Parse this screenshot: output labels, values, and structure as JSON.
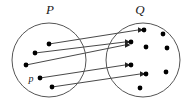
{
  "diagram": {
    "type": "set-mapping-diagram",
    "background_color": "#ffffff",
    "circle_stroke_color": "#555555",
    "dot_color": "#000000",
    "line_color": "#333333",
    "sets": [
      {
        "name": "set-p",
        "label": "P",
        "label_x": 50,
        "label_y": 13,
        "cx": 49,
        "cy": 60,
        "r": 37,
        "elements": [
          {
            "name": "p-element-1",
            "x": 49,
            "y": 44,
            "label": ""
          },
          {
            "name": "p-element-2",
            "x": 35,
            "y": 53,
            "label": ""
          },
          {
            "name": "p-element-3",
            "x": 26,
            "y": 65,
            "label": ""
          },
          {
            "name": "p-element-4",
            "x": 40,
            "y": 78,
            "label": "p",
            "label_x": 31,
            "label_y": 81
          },
          {
            "name": "p-element-5",
            "x": 52,
            "y": 87,
            "label": ""
          }
        ]
      },
      {
        "name": "set-q",
        "label": "Q",
        "label_x": 140,
        "label_y": 13,
        "cx": 143,
        "cy": 60,
        "r": 37,
        "elements": [
          {
            "name": "q-element-1",
            "x": 144,
            "y": 30,
            "label": ""
          },
          {
            "name": "q-element-2",
            "x": 131,
            "y": 42,
            "label": ""
          },
          {
            "name": "q-element-3",
            "x": 163,
            "y": 34,
            "label": ""
          },
          {
            "name": "q-element-4",
            "x": 146,
            "y": 47,
            "label": ""
          },
          {
            "name": "q-element-5",
            "x": 167,
            "y": 48,
            "label": ""
          },
          {
            "name": "q-element-6",
            "x": 131,
            "y": 65,
            "label": ""
          },
          {
            "name": "q-element-7",
            "x": 146,
            "y": 74,
            "label": ""
          },
          {
            "name": "q-element-8",
            "x": 166,
            "y": 72,
            "label": ""
          },
          {
            "name": "q-element-9",
            "x": 140,
            "y": 88,
            "label": ""
          }
        ]
      }
    ],
    "mappings": [
      {
        "name": "mapping-arrow-1",
        "from": "p-element-1",
        "to": "q-element-1",
        "x1": 49,
        "y1": 44,
        "x2": 140,
        "y2": 30
      },
      {
        "name": "mapping-arrow-2",
        "from": "p-element-2",
        "to": "q-element-2",
        "x1": 35,
        "y1": 53,
        "x2": 127,
        "y2": 42
      },
      {
        "name": "mapping-arrow-3",
        "from": "p-element-3",
        "to": "q-element-2",
        "x1": 26,
        "y1": 65,
        "x2": 127,
        "y2": 42
      },
      {
        "name": "mapping-arrow-4",
        "from": "p-element-4",
        "to": "q-element-6",
        "x1": 40,
        "y1": 78,
        "x2": 127,
        "y2": 65
      },
      {
        "name": "mapping-arrow-5",
        "from": "p-element-5",
        "to": "q-element-7",
        "x1": 52,
        "y1": 87,
        "x2": 142,
        "y2": 74
      }
    ]
  }
}
